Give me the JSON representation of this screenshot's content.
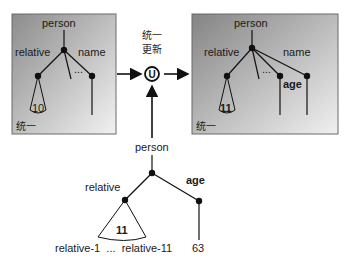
{
  "operation": {
    "label_line1": "统一",
    "label_line2": "更新",
    "symbol": "U"
  },
  "left_box": {
    "caption": "统一",
    "root": "person",
    "edge_relative": "relative",
    "edge_name": "name",
    "ellipsis": "...",
    "count": "10"
  },
  "right_box": {
    "caption": "统一",
    "root": "person",
    "edge_relative": "relative",
    "edge_name": "name",
    "edge_age": "age",
    "ellipsis": "...",
    "count": "11"
  },
  "bottom_tree": {
    "root": "person",
    "edge_relative": "relative",
    "edge_age": "age",
    "count": "11",
    "leaf_relatives": "relative-1  ...  relative-11",
    "leaf_age": "63"
  },
  "colors": {
    "box_dark": "#8a8a8a",
    "box_light": "#efefef",
    "line": "#111111"
  }
}
